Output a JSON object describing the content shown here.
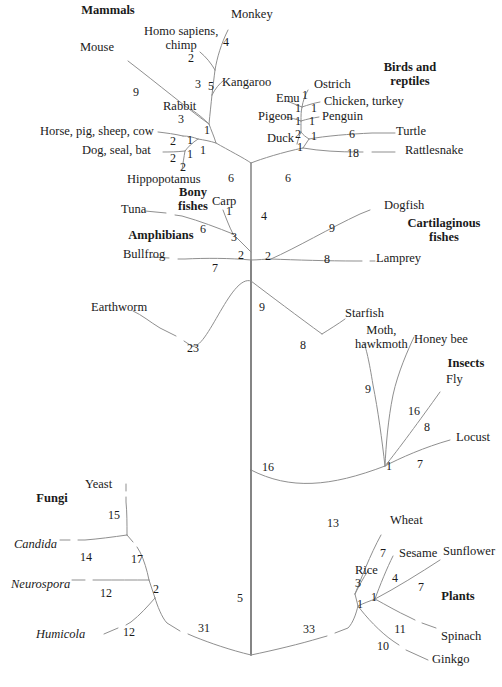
{
  "figure": {
    "type": "phylogenetic-tree",
    "line_color": "#8a8a8a",
    "trunk_color": "#6a6a6a",
    "text_color": "#1a1a1a",
    "background": "#ffffff",
    "width": 502,
    "height": 687
  },
  "group_labels": [
    {
      "name": "mammals",
      "text": "Mammals",
      "x": 108,
      "y": 12
    },
    {
      "name": "birds-and-reptiles",
      "line1": "Birds and",
      "line2": "reptiles",
      "x": 410,
      "y": 63
    },
    {
      "name": "bony-fishes",
      "line1": "Bony",
      "line2": "fishes",
      "x": 193,
      "y": 188
    },
    {
      "name": "amphibians",
      "text": "Amphibians",
      "x": 161,
      "y": 233
    },
    {
      "name": "cartilaginous-fishes",
      "line1": "Cartilaginous",
      "line2": "fishes",
      "x": 444,
      "y": 219
    },
    {
      "name": "insects",
      "text": "Insects",
      "x": 466,
      "y": 360
    },
    {
      "name": "fungi",
      "text": "Fungi",
      "x": 52,
      "y": 496
    },
    {
      "name": "plants",
      "text": "Plants",
      "x": 458,
      "y": 594
    }
  ],
  "taxa": [
    {
      "name": "monkey",
      "text": "Monkey",
      "x": 231,
      "y": 12,
      "align": "left",
      "italic": false
    },
    {
      "name": "homo-sapiens-chimp",
      "line1": "Homo sapiens,",
      "line2": "chimp",
      "x": 144,
      "y": 29,
      "align": "left",
      "italic": "first"
    },
    {
      "name": "mouse",
      "text": "Mouse",
      "x": 80,
      "y": 45,
      "align": "left",
      "italic": false
    },
    {
      "name": "kangaroo",
      "text": "Kangaroo",
      "x": 222,
      "y": 80,
      "align": "left",
      "italic": false
    },
    {
      "name": "rabbit",
      "text": "Rabbit",
      "x": 163,
      "y": 104,
      "align": "left",
      "italic": false
    },
    {
      "name": "horse-pig-sheep-cow",
      "text": "Horse, pig, sheep, cow",
      "x": 40,
      "y": 129,
      "align": "left",
      "italic": false
    },
    {
      "name": "dog-seal-bat",
      "text": "Dog, seal, bat",
      "x": 82,
      "y": 148,
      "align": "left",
      "italic": false
    },
    {
      "name": "hippopotamus",
      "text": "Hippopotamus",
      "x": 127,
      "y": 177,
      "align": "left",
      "italic": false
    },
    {
      "name": "ostrich",
      "text": "Ostrich",
      "x": 314,
      "y": 82,
      "align": "left",
      "italic": false
    },
    {
      "name": "emu",
      "text": "Emu",
      "x": 276,
      "y": 96,
      "align": "left",
      "italic": false
    },
    {
      "name": "chicken-turkey",
      "text": "Chicken, turkey",
      "x": 324,
      "y": 99,
      "align": "left",
      "italic": false
    },
    {
      "name": "pigeon",
      "text": "Pigeon",
      "x": 258,
      "y": 114,
      "align": "left",
      "italic": false
    },
    {
      "name": "penguin",
      "text": "Penguin",
      "x": 322,
      "y": 114,
      "align": "left",
      "italic": false
    },
    {
      "name": "duck",
      "text": "Duck",
      "x": 267,
      "y": 136,
      "align": "left",
      "italic": false
    },
    {
      "name": "turtle",
      "text": "Turtle",
      "x": 396,
      "y": 129,
      "align": "left",
      "italic": false
    },
    {
      "name": "rattlesnake",
      "text": "Rattlesnake",
      "x": 405,
      "y": 148,
      "align": "left",
      "italic": false
    },
    {
      "name": "tuna",
      "text": "Tuna",
      "x": 121,
      "y": 207,
      "align": "left",
      "italic": false
    },
    {
      "name": "carp",
      "text": "Carp",
      "x": 212,
      "y": 199,
      "align": "left",
      "italic": false
    },
    {
      "name": "bullfrog",
      "text": "Bullfrog",
      "x": 123,
      "y": 252,
      "align": "left",
      "italic": false
    },
    {
      "name": "dogfish",
      "text": "Dogfish",
      "x": 384,
      "y": 203,
      "align": "left",
      "italic": false
    },
    {
      "name": "lamprey",
      "text": "Lamprey",
      "x": 376,
      "y": 256,
      "align": "left",
      "italic": false
    },
    {
      "name": "earthworm",
      "text": "Earthworm",
      "x": 91,
      "y": 305,
      "align": "left",
      "italic": false
    },
    {
      "name": "starfish",
      "text": "Starfish",
      "x": 345,
      "y": 311,
      "align": "left",
      "italic": false
    },
    {
      "name": "moth-hawkmoth",
      "line1": "Moth,",
      "line2": "hawkmoth",
      "x": 355,
      "y": 328,
      "align": "left",
      "italic": false
    },
    {
      "name": "honey-bee",
      "text": "Honey bee",
      "x": 414,
      "y": 337,
      "align": "left",
      "italic": false
    },
    {
      "name": "fly",
      "text": "Fly",
      "x": 446,
      "y": 377,
      "align": "left",
      "italic": false
    },
    {
      "name": "locust",
      "text": "Locust",
      "x": 456,
      "y": 435,
      "align": "left",
      "italic": false
    },
    {
      "name": "yeast",
      "text": "Yeast",
      "x": 85,
      "y": 482,
      "align": "left",
      "italic": false
    },
    {
      "name": "candida",
      "text": "Candida",
      "x": 14,
      "y": 542,
      "align": "left",
      "italic": true
    },
    {
      "name": "neurospora",
      "text": "Neurospora",
      "x": 11,
      "y": 582,
      "align": "left",
      "italic": true
    },
    {
      "name": "humicola",
      "text": "Humicola",
      "x": 36,
      "y": 632,
      "align": "left",
      "italic": true
    },
    {
      "name": "wheat",
      "text": "Wheat",
      "x": 390,
      "y": 518,
      "align": "left",
      "italic": false
    },
    {
      "name": "sesame",
      "text": "Sesame",
      "x": 399,
      "y": 551,
      "align": "left",
      "italic": false
    },
    {
      "name": "sunflower",
      "text": "Sunflower",
      "x": 443,
      "y": 549,
      "align": "left",
      "italic": false
    },
    {
      "name": "rice",
      "text": "Rice",
      "x": 355,
      "y": 568,
      "align": "left",
      "italic": false
    },
    {
      "name": "spinach",
      "text": "Spinach",
      "x": 441,
      "y": 634,
      "align": "left",
      "italic": false
    },
    {
      "name": "ginkgo",
      "text": "Ginkgo",
      "x": 432,
      "y": 657,
      "align": "left",
      "italic": false
    }
  ],
  "branch_lengths": [
    {
      "name": "len-monkey",
      "value": "4",
      "x": 226,
      "y": 42
    },
    {
      "name": "len-homo-chimp",
      "value": "2",
      "x": 191,
      "y": 58
    },
    {
      "name": "len-mouse",
      "value": "9",
      "x": 136,
      "y": 92
    },
    {
      "name": "len-primate-node",
      "value": "5",
      "x": 211,
      "y": 86
    },
    {
      "name": "len-kangaroo",
      "value": "3",
      "x": 198,
      "y": 84
    },
    {
      "name": "len-rabbit",
      "value": "3",
      "x": 181,
      "y": 119
    },
    {
      "name": "len-rabbit-node",
      "value": "1",
      "x": 207,
      "y": 130
    },
    {
      "name": "len-horse",
      "value": "2",
      "x": 173,
      "y": 141
    },
    {
      "name": "len-horse-node",
      "value": "1",
      "x": 190,
      "y": 140
    },
    {
      "name": "len-dog",
      "value": "2",
      "x": 173,
      "y": 158
    },
    {
      "name": "len-dog-node",
      "value": "1",
      "x": 190,
      "y": 154
    },
    {
      "name": "len-mammal-node",
      "value": "1",
      "x": 203,
      "y": 150
    },
    {
      "name": "len-hippo",
      "value": "2",
      "x": 183,
      "y": 167
    },
    {
      "name": "len-mammal-stem",
      "value": "6",
      "x": 231,
      "y": 178
    },
    {
      "name": "len-ostrich",
      "value": "1",
      "x": 305,
      "y": 95
    },
    {
      "name": "len-emu",
      "value": "1",
      "x": 298,
      "y": 108
    },
    {
      "name": "len-chicken",
      "value": "1",
      "x": 314,
      "y": 108
    },
    {
      "name": "len-pigeon",
      "value": "1",
      "x": 298,
      "y": 121
    },
    {
      "name": "len-penguin",
      "value": "1",
      "x": 312,
      "y": 121
    },
    {
      "name": "len-duck-node",
      "value": "2",
      "x": 298,
      "y": 134
    },
    {
      "name": "len-duck",
      "value": "1",
      "x": 300,
      "y": 147
    },
    {
      "name": "len-bird-node",
      "value": "1",
      "x": 314,
      "y": 136
    },
    {
      "name": "len-turtle",
      "value": "6",
      "x": 352,
      "y": 134
    },
    {
      "name": "len-rattlesnake",
      "value": "18",
      "x": 353,
      "y": 153
    },
    {
      "name": "len-bird-stem",
      "value": "6",
      "x": 288,
      "y": 178
    },
    {
      "name": "len-tetrapod-stem",
      "value": "4",
      "x": 264,
      "y": 216
    },
    {
      "name": "len-carp",
      "value": "1",
      "x": 229,
      "y": 211
    },
    {
      "name": "len-tuna",
      "value": "6",
      "x": 203,
      "y": 229
    },
    {
      "name": "len-bonyfish-stem",
      "value": "3",
      "x": 234,
      "y": 237
    },
    {
      "name": "len-bullfrog",
      "value": "7",
      "x": 215,
      "y": 268
    },
    {
      "name": "len-vertebrate-node",
      "value": "2",
      "x": 241,
      "y": 255
    },
    {
      "name": "len-gnathostome-node",
      "value": "2",
      "x": 268,
      "y": 256
    },
    {
      "name": "len-dogfish",
      "value": "9",
      "x": 332,
      "y": 228
    },
    {
      "name": "len-lamprey",
      "value": "8",
      "x": 327,
      "y": 259
    },
    {
      "name": "len-chordate-stem",
      "value": "9",
      "x": 262,
      "y": 307
    },
    {
      "name": "len-earthworm",
      "value": "23",
      "x": 193,
      "y": 348
    },
    {
      "name": "len-starfish",
      "value": "8",
      "x": 303,
      "y": 345
    },
    {
      "name": "len-moth",
      "value": "9",
      "x": 368,
      "y": 389
    },
    {
      "name": "len-honeybee",
      "value": "16",
      "x": 414,
      "y": 411
    },
    {
      "name": "len-fly",
      "value": "8",
      "x": 427,
      "y": 427
    },
    {
      "name": "len-insect-node",
      "value": "1",
      "x": 389,
      "y": 466
    },
    {
      "name": "len-locust",
      "value": "7",
      "x": 420,
      "y": 464
    },
    {
      "name": "len-trunk-16",
      "value": "16",
      "x": 268,
      "y": 467
    },
    {
      "name": "len-yeast",
      "value": "15",
      "x": 114,
      "y": 515
    },
    {
      "name": "len-candida",
      "value": "14",
      "x": 86,
      "y": 557
    },
    {
      "name": "len-fungi-17",
      "value": "17",
      "x": 137,
      "y": 559
    },
    {
      "name": "len-neurospora",
      "value": "12",
      "x": 106,
      "y": 593
    },
    {
      "name": "len-fungi-node-2",
      "value": "2",
      "x": 156,
      "y": 589
    },
    {
      "name": "len-humicola",
      "value": "12",
      "x": 129,
      "y": 632
    },
    {
      "name": "len-fungi-stem",
      "value": "31",
      "x": 204,
      "y": 628
    },
    {
      "name": "len-trunk-5",
      "value": "5",
      "x": 240,
      "y": 598
    },
    {
      "name": "len-plant-stem",
      "value": "33",
      "x": 309,
      "y": 629
    },
    {
      "name": "len-arthropod-stem",
      "value": "13",
      "x": 333,
      "y": 523
    },
    {
      "name": "len-wheat",
      "value": "7",
      "x": 383,
      "y": 553
    },
    {
      "name": "len-sesame",
      "value": "4",
      "x": 395,
      "y": 578
    },
    {
      "name": "len-sunflower",
      "value": "7",
      "x": 421,
      "y": 587
    },
    {
      "name": "len-rice",
      "value": "3",
      "x": 358,
      "y": 583
    },
    {
      "name": "len-monocot-node",
      "value": "1",
      "x": 360,
      "y": 604
    },
    {
      "name": "len-dicot-node",
      "value": "1",
      "x": 374,
      "y": 597
    },
    {
      "name": "len-spinach",
      "value": "11",
      "x": 400,
      "y": 629
    },
    {
      "name": "len-ginkgo",
      "value": "10",
      "x": 383,
      "y": 646
    }
  ]
}
